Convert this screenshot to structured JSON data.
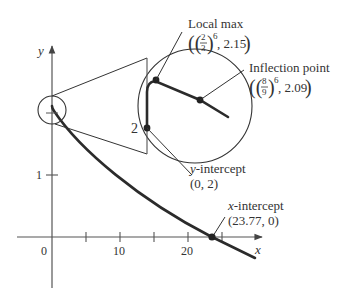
{
  "axes": {
    "x_label": "x",
    "y_label": "y",
    "origin_label": "0",
    "x_ticks": [
      "10",
      "20"
    ],
    "y_ticks": [
      "1"
    ]
  },
  "magnifier": {
    "y_value_label": "2"
  },
  "annotations": {
    "local_max": {
      "title": "Local max",
      "coord_frac_num": "2",
      "coord_frac_den": "3",
      "coord_exp": "6",
      "coord_y": ", 2.15"
    },
    "inflection": {
      "title": "Inflection point",
      "coord_frac_num": "8",
      "coord_frac_den": "9",
      "coord_exp": "6",
      "coord_y": ", 2.09"
    },
    "y_intercept": {
      "title_var": "y",
      "title_rest": "-intercept",
      "coords": "(0, 2)"
    },
    "x_intercept": {
      "title_var": "x",
      "title_rest": "-intercept",
      "coords": "(23.77, 0)"
    }
  },
  "colors": {
    "ink": "#2b2b2b",
    "axis": "#555555",
    "text": "#333333"
  }
}
